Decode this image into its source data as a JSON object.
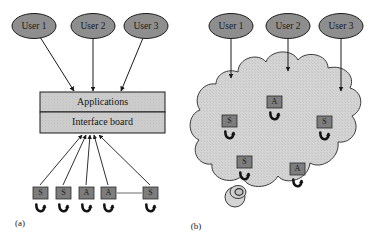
{
  "figure": {
    "background": "#ffffff",
    "panels": [
      {
        "id": "panel-a",
        "caption": "(a)",
        "caption_x": 20,
        "caption_y": 224,
        "users": [
          {
            "label": "User 1",
            "cx": 34,
            "cy": 26
          },
          {
            "label": "User 2",
            "cx": 93,
            "cy": 26
          },
          {
            "label": "User 3",
            "cx": 146,
            "cy": 26
          }
        ],
        "boxes": [
          {
            "label": "Applications",
            "x": 40,
            "y": 92,
            "w": 125,
            "h": 20
          },
          {
            "label": "Interface board",
            "x": 40,
            "y": 112,
            "w": 125,
            "h": 20
          }
        ],
        "user_links": [
          {
            "x1": 40,
            "y1": 37,
            "x2": 74,
            "y2": 91
          },
          {
            "x1": 93,
            "y1": 38,
            "x2": 93,
            "y2": 91
          },
          {
            "x1": 143,
            "y1": 38,
            "x2": 121,
            "y2": 91
          }
        ],
        "devices": [
          {
            "label": "S",
            "x": 33,
            "y": 187,
            "w": 15,
            "h": 12
          },
          {
            "label": "S",
            "x": 56,
            "y": 187,
            "w": 15,
            "h": 12
          },
          {
            "label": "A",
            "x": 79,
            "y": 187,
            "w": 15,
            "h": 12
          },
          {
            "label": "A",
            "x": 101,
            "y": 187,
            "w": 15,
            "h": 12
          },
          {
            "label": "S",
            "x": 143,
            "y": 187,
            "w": 15,
            "h": 12
          }
        ],
        "device_links": [
          {
            "x1": 40,
            "y1": 186,
            "x2": 82,
            "y2": 134
          },
          {
            "x1": 63,
            "y1": 186,
            "x2": 86,
            "y2": 134
          },
          {
            "x1": 86,
            "y1": 186,
            "x2": 90,
            "y2": 134
          },
          {
            "x1": 108,
            "y1": 186,
            "x2": 94,
            "y2": 134
          },
          {
            "x1": 150,
            "y1": 186,
            "x2": 98,
            "y2": 134
          }
        ],
        "ellipsis_connector": {
          "x1": 117,
          "y1": 193,
          "x2": 142,
          "y2": 193
        }
      },
      {
        "id": "panel-b",
        "caption": "(b)",
        "caption_x": 196,
        "caption_y": 227,
        "users": [
          {
            "label": "User 1",
            "cx": 231,
            "cy": 26
          },
          {
            "label": "User 2",
            "cx": 288,
            "cy": 26
          },
          {
            "label": "User 3",
            "cx": 341,
            "cy": 26
          }
        ],
        "user_links": [
          {
            "x1": 231,
            "y1": 38,
            "x2": 231,
            "y2": 77
          },
          {
            "x1": 288,
            "y1": 38,
            "x2": 288,
            "y2": 70
          },
          {
            "x1": 341,
            "y1": 38,
            "x2": 341,
            "y2": 91
          }
        ],
        "cloud_label": "network cloud",
        "devices": [
          {
            "label": "A",
            "x": 267,
            "y": 96,
            "w": 15,
            "h": 12
          },
          {
            "label": "S",
            "x": 222,
            "y": 115,
            "w": 15,
            "h": 12
          },
          {
            "label": "S",
            "x": 317,
            "y": 116,
            "w": 15,
            "h": 12
          },
          {
            "label": "S",
            "x": 237,
            "y": 156,
            "w": 15,
            "h": 12
          },
          {
            "label": "A",
            "x": 290,
            "y": 163,
            "w": 15,
            "h": 12
          }
        ],
        "gateway": {
          "cx": 235,
          "cy": 196,
          "r": 10
        }
      }
    ],
    "colors": {
      "user_fill": "#8e8e8e",
      "box_fill": "#cfcfcf",
      "device_fill": "#7d7d7d",
      "cloud_fill": "#d2d2d2",
      "stroke": "#1a1a1a"
    }
  }
}
